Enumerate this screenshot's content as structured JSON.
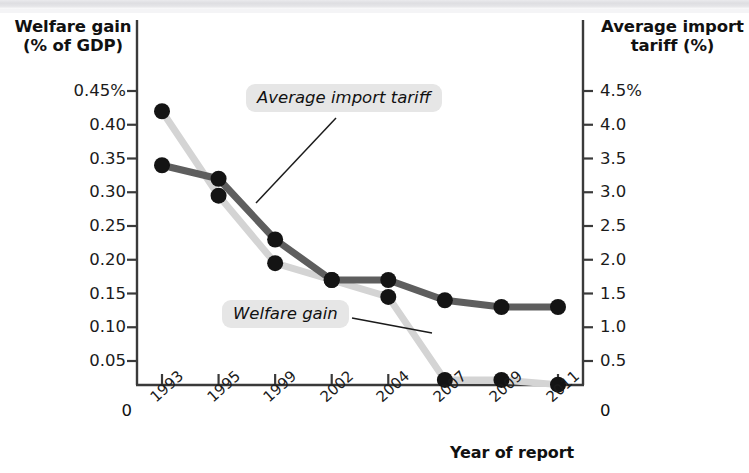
{
  "figure": {
    "left_axis_title": "Welfare gain\n(% of GDP)",
    "right_axis_title": "Average import\ntariff (%)",
    "x_axis_title": "Year of report",
    "left_zero": "0",
    "right_zero": "0",
    "callouts": {
      "tariff": "Average import tariff",
      "welfare": "Welfare gain"
    },
    "colors": {
      "tariff_line": "#5e5e5e",
      "welfare_line": "#d4d4d4",
      "marker": "#141414",
      "axis": "#3a3a3a",
      "callout_background": "#e6e6e6",
      "text": "#111111"
    }
  },
  "chart_data": {
    "type": "line",
    "title": "",
    "xlabel": "Year of report",
    "categories": [
      "1993",
      "1995",
      "1999",
      "2002",
      "2004",
      "2007",
      "2009",
      "2011"
    ],
    "grid": false,
    "legend": "annotated-callouts",
    "axes": {
      "left": {
        "label": "Welfare gain (% of GDP)",
        "ticks": [
          "0",
          "0.05",
          "0.10",
          "0.15",
          "0.20",
          "0.25",
          "0.30",
          "0.35",
          "0.40",
          "0.45%"
        ],
        "tick_values": [
          0,
          0.05,
          0.1,
          0.15,
          0.2,
          0.25,
          0.3,
          0.35,
          0.4,
          0.45
        ],
        "ylim": [
          0,
          0.45
        ],
        "unit": "%"
      },
      "right": {
        "label": "Average import tariff (%)",
        "ticks": [
          "0",
          "0.5",
          "1.0",
          "1.5",
          "2.0",
          "2.5",
          "3.0",
          "3.5",
          "4.0",
          "4.5%"
        ],
        "tick_values": [
          0,
          0.5,
          1.0,
          1.5,
          2.0,
          2.5,
          3.0,
          3.5,
          4.0,
          4.5
        ],
        "ylim": [
          0,
          4.5
        ],
        "unit": "%"
      }
    },
    "series": [
      {
        "name": "Welfare gain",
        "axis": "left",
        "color": "#d4d4d4",
        "unit": "% of GDP",
        "values": [
          0.42,
          0.295,
          0.195,
          0.17,
          0.145,
          0.022,
          0.022,
          0.015
        ]
      },
      {
        "name": "Average import tariff",
        "axis": "right",
        "color": "#5e5e5e",
        "unit": "%",
        "values": [
          3.4,
          3.2,
          2.3,
          1.7,
          1.7,
          1.4,
          1.3,
          1.3
        ]
      }
    ]
  }
}
